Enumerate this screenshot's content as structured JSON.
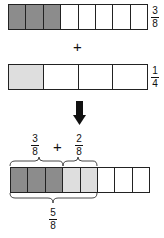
{
  "rows": [
    {
      "cells": [
        "dark",
        "dark",
        "dark",
        "white",
        "white",
        "white",
        "white",
        "white"
      ],
      "fraction": {
        "num": "3",
        "den": "8"
      }
    },
    {
      "cells": [
        "light",
        "white",
        "white",
        "white"
      ],
      "fraction": {
        "num": "1",
        "den": "4"
      }
    },
    {
      "cells": [
        "dark",
        "dark",
        "dark",
        "light",
        "light",
        "white",
        "white",
        "white"
      ]
    }
  ],
  "plus_symbol": "+",
  "result": {
    "left": {
      "num": "3",
      "den": "8"
    },
    "operator": "+",
    "right": {
      "num": "2",
      "den": "8"
    },
    "sum": {
      "num": "5",
      "den": "8"
    }
  },
  "colors": {
    "dark": "#8c8c8c",
    "light": "#dedede",
    "stroke": "#222222"
  }
}
